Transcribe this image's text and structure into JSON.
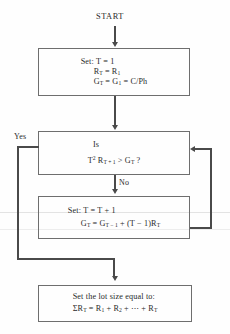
{
  "diagram": {
    "start_label": "START",
    "branch_yes": "Yes",
    "branch_no": "No",
    "nodes": {
      "setup": {
        "line1": "Set:  T   = 1",
        "line2_lhs": "R",
        "line2_lhs_sub": "T",
        "line2_eq": " = R",
        "line2_rhs_sub": "1",
        "line3_lhs": "G",
        "line3_lhs_sub": "T",
        "line3_mid": " = G",
        "line3_mid_sub": "1",
        "line3_rhs": " = C/Ph"
      },
      "decision": {
        "line1": "Is",
        "line2_t": "T",
        "line2_t_sup": "2",
        "line2_r": " R",
        "line2_r_sub": "T + 1",
        "line2_gt": " > G",
        "line2_g_sub": "T",
        "line2_q": " ?"
      },
      "update": {
        "line1": "Set:  T  = T + 1",
        "line2_g": "G",
        "line2_g_sub": "T",
        "line2_eq": " = G",
        "line2_prev_sub": "T − 1",
        "line2_tail": " + (T − 1)R",
        "line2_tail_sub": "T"
      },
      "result": {
        "line1": "Set the lot size equal to:",
        "line2_sigma": "ΣR",
        "line2_sigma_sub": "T",
        "line2_eq": " = R",
        "line2_r1_sub": "1",
        "line2_plus1": " + R",
        "line2_r2_sub": "2",
        "line2_plus2": " + ⋯ + R",
        "line2_rt_sub": "T"
      }
    },
    "colors": {
      "ink": "#2a2a2a",
      "box_border": "#6e6e6e",
      "connector": "#4a4a4a",
      "paper": "#fefefe"
    }
  }
}
